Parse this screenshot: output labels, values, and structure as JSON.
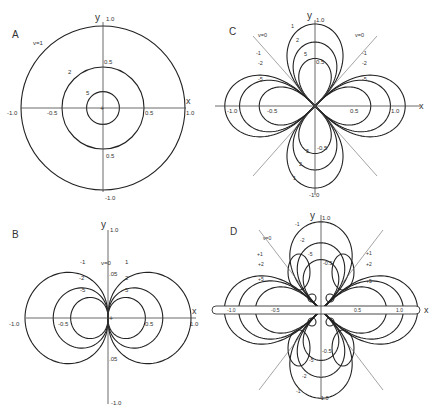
{
  "figure": {
    "panels": [
      {
        "id": "A",
        "label": "A",
        "type": "monopole-circles",
        "origin": [
          103,
          108
        ],
        "unit_px": 82,
        "axis_labels": {
          "x": "x",
          "y": "y"
        },
        "ticks": {
          "x_neg_1": "-1.0",
          "x_neg_05": "-0.5",
          "x_pos_05": "0.5",
          "x_pos_1": "1.0",
          "y_pos_1": "1.0",
          "y_pos_05": "0.5",
          "y_neg_05": "0.5",
          "y_neg_1": "-1.0"
        },
        "curves": [
          {
            "v": "v=1",
            "radius": 1.0
          },
          {
            "v": "2",
            "radius": 0.5
          },
          {
            "v": "5",
            "radius": 0.2
          }
        ]
      },
      {
        "id": "B",
        "label": "B",
        "type": "dipole",
        "origin": [
          110,
          318
        ],
        "unit_px": 83,
        "axis_labels": {
          "x": "x",
          "y": "y"
        },
        "ticks": {
          "x_neg_1": "-1.0",
          "x_neg_05": "-0.5",
          "x_pos_05": "0.5",
          "x_pos_1": "1.0",
          "y_pos_1": "1.0",
          "y_pos_05": ".05",
          "y_neg_05": ".05",
          "y_neg_1": "-1.0"
        },
        "zero_label": "v=0",
        "curves": [
          {
            "v": "1",
            "side": "right",
            "reach": 1.0
          },
          {
            "v": "2",
            "side": "right",
            "reach": 0.66
          },
          {
            "v": "5",
            "side": "right",
            "reach": 0.45
          },
          {
            "v": "-1",
            "side": "left",
            "reach": 1.0
          },
          {
            "v": "-2",
            "side": "left",
            "reach": 0.66
          },
          {
            "v": "-5",
            "side": "left",
            "reach": 0.45
          }
        ]
      },
      {
        "id": "C",
        "label": "C",
        "type": "quadrupole",
        "origin": [
          315,
          106
        ],
        "unit_px": 82,
        "axis_labels": {
          "x": "x",
          "y": "y"
        },
        "ticks": {
          "x_neg_1": "-1.0",
          "x_neg_05": "-0.5",
          "x_pos_05": "0.5",
          "x_pos_1": "1.0",
          "y_pos_1": "1.0",
          "y_pos_05": "0.5",
          "y_neg_05": "-0.5",
          "y_neg_1": "-1.0"
        },
        "zero_label": "v=0",
        "curves": [
          {
            "v": "1",
            "axis": "y",
            "reach": 1.0
          },
          {
            "v": "2",
            "axis": "y",
            "reach": 0.78
          },
          {
            "v": "5",
            "axis": "y",
            "reach": 0.58
          },
          {
            "v": "-1",
            "axis": "x",
            "reach": 1.1
          },
          {
            "v": "-2",
            "axis": "x",
            "reach": 0.92
          },
          {
            "v": "-5",
            "axis": "x",
            "reach": 0.68
          }
        ]
      },
      {
        "id": "D",
        "label": "D",
        "type": "quadrupole-with-tube",
        "origin": [
          321,
          310
        ],
        "unit_px": 84,
        "axis_labels": {
          "x": "x",
          "y": "y"
        },
        "ticks": {
          "x_neg_1": "-1.0",
          "x_neg_05": "-0.5",
          "x_pos_05": "0.5",
          "x_pos_1": "1.0",
          "y_pos_1": "1.0",
          "y_pos_05": "-0.5",
          "y_neg_05": "-0.5",
          "y_neg_1": "-1.0"
        },
        "zero_label": "v=0",
        "curves": [
          {
            "v": "-1",
            "axis": "y",
            "reach": 1.05
          },
          {
            "v": "-2",
            "axis": "y",
            "reach": 0.8
          },
          {
            "v": "-5",
            "axis": "y",
            "reach": 0.6
          },
          {
            "v": "+1",
            "axis": "x",
            "reach": 1.15
          },
          {
            "v": "+2",
            "axis": "x",
            "reach": 0.98
          },
          {
            "v": "+5",
            "axis": "x",
            "reach": 0.78
          }
        ]
      }
    ]
  }
}
